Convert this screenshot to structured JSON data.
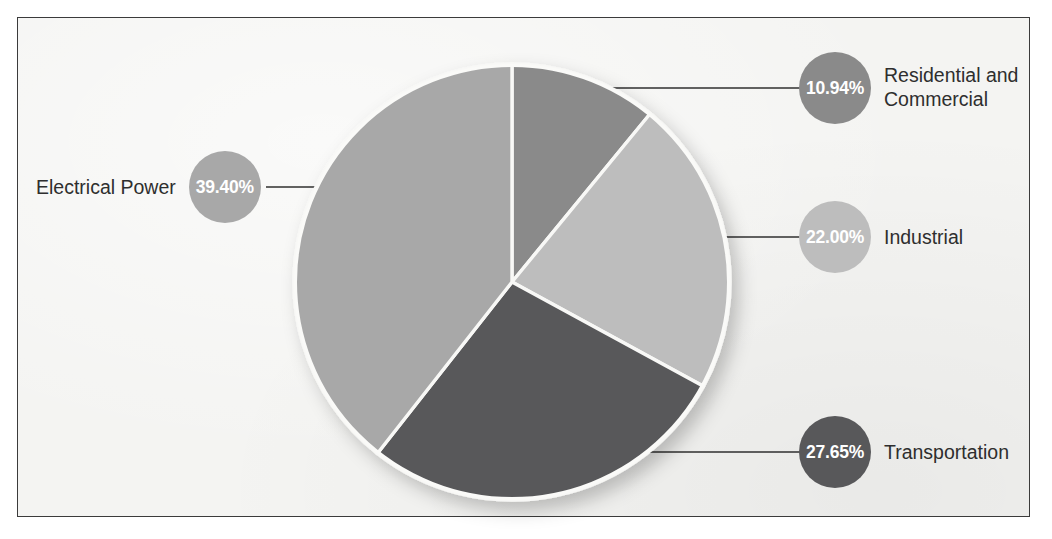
{
  "figure": {
    "background_color": "#f4f4f2",
    "border_color": "#3b3b3b",
    "page_color": "#ffffff"
  },
  "chart_data": {
    "type": "pie",
    "title": "",
    "subtitle": "",
    "xlabel": "",
    "ylabel": "",
    "legend_position": "callouts",
    "grid": false,
    "start_angle_deg": 0,
    "direction": "clockwise",
    "units": "percent",
    "total": 99.99,
    "categories": [
      "Residential and Commercial",
      "Industrial",
      "Transportation",
      "Electrical Power"
    ],
    "values": [
      10.94,
      22.0,
      27.65,
      39.4
    ],
    "value_labels": [
      "10.94%",
      "22.00%",
      "27.65%",
      "39.40%"
    ],
    "colors": [
      "#8a8a8a",
      "#bdbdbd",
      "#58585a",
      "#a8a8a8"
    ],
    "slices": [
      {
        "label": "Residential and Commercial",
        "value": 10.94,
        "value_label": "10.94%",
        "color": "#8a8a8a",
        "start_angle_deg": 0.0,
        "end_angle_deg": 39.38
      },
      {
        "label": "Industrial",
        "value": 22.0,
        "value_label": "22.00%",
        "color": "#bdbdbd",
        "start_angle_deg": 39.38,
        "end_angle_deg": 118.58
      },
      {
        "label": "Transportation",
        "value": 27.65,
        "value_label": "27.65%",
        "color": "#58585a",
        "start_angle_deg": 118.58,
        "end_angle_deg": 218.12
      },
      {
        "label": "Electrical Power",
        "value": 39.4,
        "value_label": "39.40%",
        "color": "#a8a8a8",
        "start_angle_deg": 218.12,
        "end_angle_deg": 360.0
      }
    ]
  },
  "callouts": {
    "residential": {
      "percent": "10.94%",
      "label_line1": "Residential and",
      "label_line2": "Commercial",
      "color": "#8a8a8a"
    },
    "industrial": {
      "percent": "22.00%",
      "label": "Industrial",
      "color": "#bdbdbd"
    },
    "transportation": {
      "percent": "27.65%",
      "label": "Transportation",
      "color": "#58585a"
    },
    "electrical": {
      "percent": "39.40%",
      "label": "Electrical Power",
      "color": "#a8a8a8"
    }
  }
}
